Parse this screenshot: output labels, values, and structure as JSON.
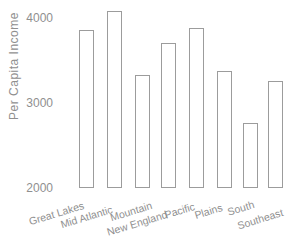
{
  "chart_data": {
    "type": "bar",
    "title": "",
    "xlabel": "",
    "ylabel": "Per Capita Income",
    "categories": [
      "Great Lakes",
      "Mid Atlantic",
      "Mountain",
      "New England",
      "Pacific",
      "Plains",
      "South",
      "Southeast"
    ],
    "values": [
      3860,
      4080,
      3330,
      3710,
      3880,
      3380,
      2760,
      3260
    ],
    "yticks": [
      4000,
      3000,
      2000
    ],
    "ylim": [
      2000,
      4200
    ],
    "grid": false,
    "legend_position": "none",
    "bar_fill": "#ffffff",
    "bar_border": "#9c9c9c",
    "text_color": "#8f8f8f"
  }
}
